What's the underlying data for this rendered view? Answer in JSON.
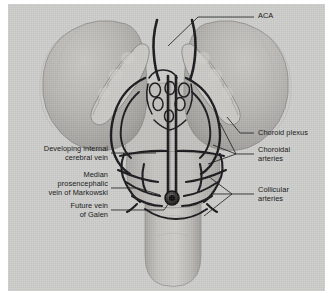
{
  "figure": {
    "background_color": "#cdcdcb",
    "ink_color": "#1a1a1a",
    "border_color": "#ffffff"
  },
  "labels": {
    "aca": "ACA",
    "choroid_plexus": "Choroid plexus",
    "choroidal_arteries_l1": "Choroidal",
    "choroidal_arteries_l2": "arteries",
    "collicular_arteries_l1": "Collicular",
    "collicular_arteries_l2": "arteries",
    "internal_cerebral_vein_l1": "Developing internal",
    "internal_cerebral_vein_l2": "cerebral vein",
    "markowski_l1": "Median",
    "markowski_l2": "prosencephalic",
    "markowski_l3": "vein of Markowski",
    "vein_of_galen_l1": "Future vein",
    "vein_of_galen_l2": "of Galen"
  },
  "structures": {
    "left_hemisphere": "cerebral-hemisphere-left",
    "right_hemisphere": "cerebral-hemisphere-right",
    "left_choroid_plexus": "choroid-plexus-left",
    "right_choroid_plexus": "choroid-plexus-right",
    "brainstem": "brainstem-medulla",
    "midbrain_plate": "midbrain-tectal-plate",
    "median_vein": "median-prosencephalic-vein",
    "galen_ostium": "vein-of-galen-ostium",
    "choroidal_plexiform_network": "choroidal-vascular-plexus",
    "collicular_network": "collicular-arterial-network"
  }
}
